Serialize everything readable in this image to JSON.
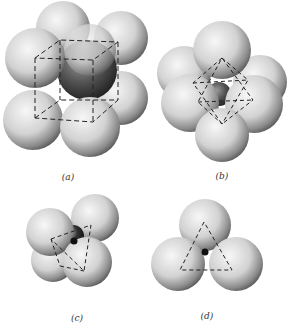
{
  "figure": {
    "panels": [
      {
        "id": "a",
        "label": "(a)",
        "description": "cubic coordination: 8 spheres around central atom",
        "label_pos": [
          68,
          172
        ]
      },
      {
        "id": "b",
        "label": "(b)",
        "description": "octahedral coordination: 6 spheres around central atom",
        "label_pos": [
          222,
          171
        ]
      },
      {
        "id": "c",
        "label": "(c)",
        "description": "tetrahedral coordination: 4 spheres around central atom",
        "label_pos": [
          77,
          313
        ]
      },
      {
        "id": "d",
        "label": "(d)",
        "description": "triangular coordination: 3 spheres around central atom",
        "label_pos": [
          207,
          311
        ]
      }
    ],
    "colors": {
      "sphere_light": "#f4f4f4",
      "sphere_dark": "#555555",
      "center_atom": "#2a2a2a",
      "dashed_line": "#222222",
      "background": "#ffffff"
    }
  }
}
